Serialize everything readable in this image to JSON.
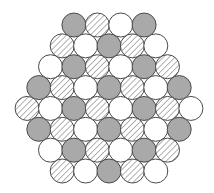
{
  "diagram": {
    "type": "hexagonal-close-packed-circles",
    "colors": {
      "gray_fill": "#a9a9a9",
      "white_fill": "#ffffff",
      "hatch_line": "#8a8a8a",
      "outline": "#4a4a4a"
    },
    "legend_types": [
      "gray",
      "hatched",
      "white"
    ],
    "geometry": {
      "radius": 12,
      "spacing_x": 23.4,
      "row_start_y": 25,
      "row_step_y": 20.86,
      "center_x": 109
    },
    "rows": [
      [
        "gray",
        "hatched",
        "white",
        "gray"
      ],
      [
        "hatched",
        "white",
        "gray",
        "hatched",
        "white"
      ],
      [
        "white",
        "gray",
        "hatched",
        "white",
        "gray",
        "hatched"
      ],
      [
        "gray",
        "hatched",
        "white",
        "gray",
        "hatched",
        "white",
        "gray"
      ],
      [
        "hatched",
        "white",
        "gray",
        "hatched",
        "white",
        "gray",
        "hatched",
        "white"
      ],
      [
        "gray",
        "hatched",
        "white",
        "gray",
        "hatched",
        "white",
        "gray"
      ],
      [
        "white",
        "gray",
        "hatched",
        "white",
        "gray",
        "hatched"
      ],
      [
        "hatched",
        "white",
        "gray",
        "hatched",
        "white"
      ]
    ]
  }
}
